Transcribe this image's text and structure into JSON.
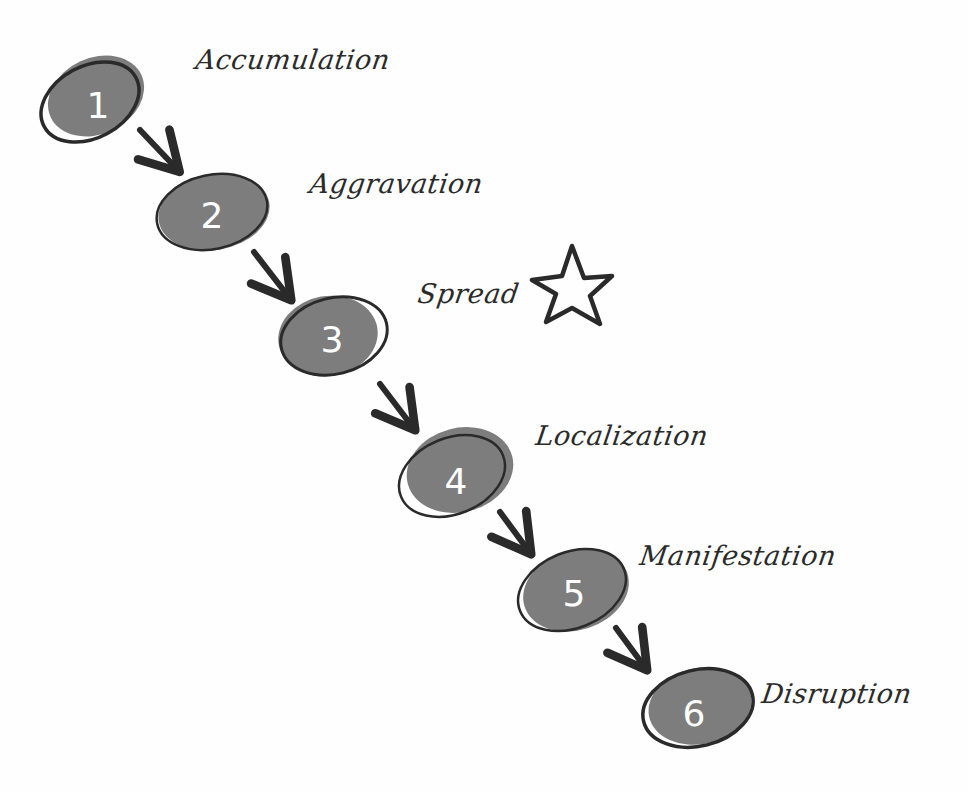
{
  "diagram": {
    "type": "sequential-process",
    "style": "hand-drawn",
    "colors": {
      "blob_fill": "#7d7d7d",
      "outline": "#2a2a2a",
      "number": "#ffffff",
      "background": "#fefefe",
      "text": "#2b2b2b"
    },
    "steps": [
      {
        "number": "1",
        "label": "Accumulation"
      },
      {
        "number": "2",
        "label": "Aggravation"
      },
      {
        "number": "3",
        "label": "Spread",
        "marker": "star-icon"
      },
      {
        "number": "4",
        "label": "Localization"
      },
      {
        "number": "5",
        "label": "Manifestation"
      },
      {
        "number": "6",
        "label": "Disruption"
      }
    ]
  }
}
